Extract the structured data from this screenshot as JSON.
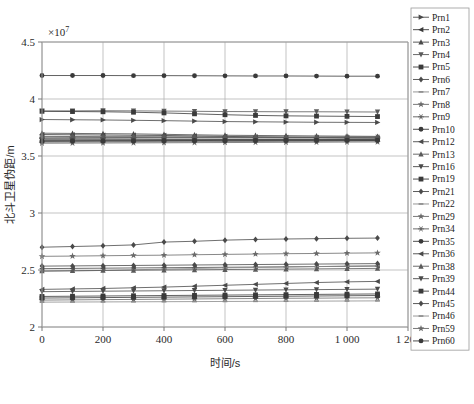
{
  "chart_data": {
    "type": "line",
    "title": "",
    "xlabel": "时间/s",
    "ylabel": "北斗卫星伪距/m",
    "y_multiplier": "×10",
    "y_multiplier_exponent": "7",
    "xlim": [
      0,
      1200
    ],
    "ylim": [
      2.0,
      4.5
    ],
    "xticks": [
      0,
      200,
      400,
      600,
      800,
      1000,
      1200
    ],
    "xticklabels": [
      "0",
      "200",
      "400",
      "600",
      "800",
      "1 000",
      "1 200"
    ],
    "yticks": [
      2,
      2.5,
      3,
      3.5,
      4,
      4.5
    ],
    "yticklabels": [
      "2",
      "2.5",
      "3",
      "3.5",
      "4",
      "4.5"
    ],
    "grid": true,
    "grid_axis": "both",
    "legend_position": "right-outside",
    "x": [
      0,
      100,
      200,
      300,
      400,
      500,
      600,
      700,
      800,
      900,
      1000,
      1100
    ],
    "series": [
      {
        "name": "Prn1",
        "marker": "triangle-right",
        "color": "#4a4a4a",
        "values": [
          3.82,
          3.818,
          3.816,
          3.813,
          3.81,
          3.806,
          3.802,
          3.8,
          3.798,
          3.796,
          3.795,
          3.794
        ]
      },
      {
        "name": "Prn2",
        "marker": "triangle-left",
        "color": "#3a3a3a",
        "values": [
          3.688,
          3.686,
          3.684,
          3.682,
          3.68,
          3.676,
          3.672,
          3.668,
          3.664,
          3.662,
          3.66,
          3.658
        ]
      },
      {
        "name": "Prn3",
        "marker": "triangle-up",
        "color": "#4a4a4a",
        "values": [
          3.7,
          3.698,
          3.696,
          3.694,
          3.69,
          3.686,
          3.682,
          3.68,
          3.678,
          3.676,
          3.674,
          3.672
        ]
      },
      {
        "name": "Prn4",
        "marker": "triangle-down",
        "color": "#5a5a5a",
        "values": [
          3.895,
          3.896,
          3.897,
          3.896,
          3.894,
          3.892,
          3.89,
          3.889,
          3.888,
          3.888,
          3.887,
          3.886
        ]
      },
      {
        "name": "Prn5",
        "marker": "square",
        "color": "#3a3a3a",
        "values": [
          3.892,
          3.89,
          3.888,
          3.884,
          3.878,
          3.87,
          3.862,
          3.856,
          3.852,
          3.85,
          3.848,
          3.846
        ]
      },
      {
        "name": "Prn6",
        "marker": "diamond",
        "color": "#4a4a4a",
        "values": [
          3.648,
          3.648,
          3.648,
          3.647,
          3.646,
          3.646,
          3.645,
          3.645,
          3.644,
          3.644,
          3.643,
          3.643
        ]
      },
      {
        "name": "Prn7",
        "marker": "dash",
        "color": "#8a8a8a",
        "values": [
          3.62,
          3.621,
          3.622,
          3.623,
          3.624,
          3.625,
          3.626,
          3.627,
          3.628,
          3.629,
          3.63,
          3.631
        ]
      },
      {
        "name": "Prn8",
        "marker": "star",
        "color": "#6a6a6a",
        "values": [
          2.62,
          2.622,
          2.625,
          2.628,
          2.63,
          2.634,
          2.637,
          2.64,
          2.643,
          2.645,
          2.648,
          2.65
        ]
      },
      {
        "name": "Prn9",
        "marker": "asterisk",
        "color": "#5a5a5a",
        "values": [
          3.665,
          3.664,
          3.663,
          3.662,
          3.661,
          3.66,
          3.659,
          3.658,
          3.657,
          3.657,
          3.656,
          3.656
        ]
      },
      {
        "name": "Prn10",
        "marker": "circle",
        "color": "#3a3a3a",
        "values": [
          4.206,
          4.206,
          4.206,
          4.205,
          4.205,
          4.204,
          4.203,
          4.202,
          4.202,
          4.201,
          4.2,
          4.2
        ]
      },
      {
        "name": "Prn12",
        "marker": "triangle-left",
        "color": "#4a4a4a",
        "values": [
          2.512,
          2.514,
          2.516,
          2.518,
          2.52,
          2.522,
          2.524,
          2.526,
          2.528,
          2.53,
          2.532,
          2.534
        ]
      },
      {
        "name": "Prn13",
        "marker": "triangle-up",
        "color": "#5a5a5a",
        "values": [
          3.672,
          3.671,
          3.67,
          3.67,
          3.669,
          3.668,
          3.668,
          3.667,
          3.667,
          3.666,
          3.666,
          3.665
        ]
      },
      {
        "name": "Prn16",
        "marker": "triangle-down",
        "color": "#4a4a4a",
        "values": [
          3.64,
          3.64,
          3.641,
          3.641,
          3.642,
          3.642,
          3.643,
          3.643,
          3.644,
          3.644,
          3.645,
          3.645
        ]
      },
      {
        "name": "Prn19",
        "marker": "square",
        "color": "#3a3a3a",
        "values": [
          2.268,
          2.27,
          2.272,
          2.274,
          2.276,
          2.278,
          2.28,
          2.282,
          2.284,
          2.286,
          2.288,
          2.29
        ]
      },
      {
        "name": "Prn21",
        "marker": "diamond",
        "color": "#4a4a4a",
        "values": [
          2.7,
          2.706,
          2.712,
          2.72,
          2.745,
          2.752,
          2.762,
          2.768,
          2.772,
          2.775,
          2.778,
          2.78
        ]
      },
      {
        "name": "Prn22",
        "marker": "dash",
        "color": "#8a8a8a",
        "values": [
          2.488,
          2.492,
          2.496,
          2.502,
          2.508,
          2.513,
          2.518,
          2.522,
          2.526,
          2.53,
          2.534,
          2.538
        ]
      },
      {
        "name": "Prn29",
        "marker": "star",
        "color": "#6a6a6a",
        "values": [
          2.236,
          2.238,
          2.24,
          2.242,
          2.244,
          2.246,
          2.248,
          2.25,
          2.252,
          2.253,
          2.255,
          2.256
        ]
      },
      {
        "name": "Prn34",
        "marker": "asterisk",
        "color": "#5a5a5a",
        "values": [
          3.655,
          3.656,
          3.657,
          3.658,
          3.659,
          3.66,
          3.661,
          3.662,
          3.663,
          3.664,
          3.665,
          3.666
        ]
      },
      {
        "name": "Prn35",
        "marker": "circle",
        "color": "#3a3a3a",
        "values": [
          3.634,
          3.634,
          3.635,
          3.635,
          3.636,
          3.636,
          3.637,
          3.637,
          3.638,
          3.638,
          3.639,
          3.639
        ]
      },
      {
        "name": "Prn36",
        "marker": "triangle-left",
        "color": "#4a4a4a",
        "values": [
          2.33,
          2.334,
          2.338,
          2.344,
          2.35,
          2.358,
          2.366,
          2.374,
          2.382,
          2.39,
          2.396,
          2.4
        ]
      },
      {
        "name": "Prn38",
        "marker": "triangle-up",
        "color": "#5a5a5a",
        "values": [
          2.492,
          2.494,
          2.496,
          2.498,
          2.5,
          2.502,
          2.504,
          2.506,
          2.508,
          2.51,
          2.512,
          2.514
        ]
      },
      {
        "name": "Prn39",
        "marker": "triangle-down",
        "color": "#4a4a4a",
        "values": [
          2.31,
          2.312,
          2.314,
          2.316,
          2.318,
          2.32,
          2.322,
          2.324,
          2.326,
          2.328,
          2.33,
          2.332
        ]
      },
      {
        "name": "Prn44",
        "marker": "square",
        "color": "#3a3a3a",
        "values": [
          2.254,
          2.256,
          2.258,
          2.26,
          2.262,
          2.264,
          2.266,
          2.268,
          2.27,
          2.272,
          2.274,
          2.276
        ]
      },
      {
        "name": "Prn45",
        "marker": "diamond",
        "color": "#4a4a4a",
        "values": [
          2.534,
          2.536,
          2.538,
          2.54,
          2.542,
          2.544,
          2.546,
          2.548,
          2.55,
          2.552,
          2.554,
          2.556
        ]
      },
      {
        "name": "Prn46",
        "marker": "dash",
        "color": "#8a8a8a",
        "values": [
          2.218,
          2.219,
          2.22,
          2.221,
          2.222,
          2.223,
          2.224,
          2.225,
          2.226,
          2.227,
          2.228,
          2.229
        ]
      },
      {
        "name": "Prn59",
        "marker": "star",
        "color": "#6a6a6a",
        "values": [
          3.612,
          3.613,
          3.614,
          3.615,
          3.616,
          3.617,
          3.618,
          3.619,
          3.62,
          3.621,
          3.622,
          3.623
        ]
      },
      {
        "name": "Prn60",
        "marker": "circle",
        "color": "#3a3a3a",
        "values": [
          3.628,
          3.629,
          3.63,
          3.63,
          3.631,
          3.632,
          3.632,
          3.633,
          3.634,
          3.634,
          3.635,
          3.636
        ]
      }
    ]
  },
  "legend": {
    "entries": [
      "Prn1",
      "Prn2",
      "Prn3",
      "Prn4",
      "Prn5",
      "Prn6",
      "Prn7",
      "Prn8",
      "Prn9",
      "Prn10",
      "Prn12",
      "Prn13",
      "Prn16",
      "Prn19",
      "Prn21",
      "Prn22",
      "Prn29",
      "Prn34",
      "Prn35",
      "Prn36",
      "Prn38",
      "Prn39",
      "Prn44",
      "Prn45",
      "Prn46",
      "Prn59",
      "Prn60"
    ]
  }
}
